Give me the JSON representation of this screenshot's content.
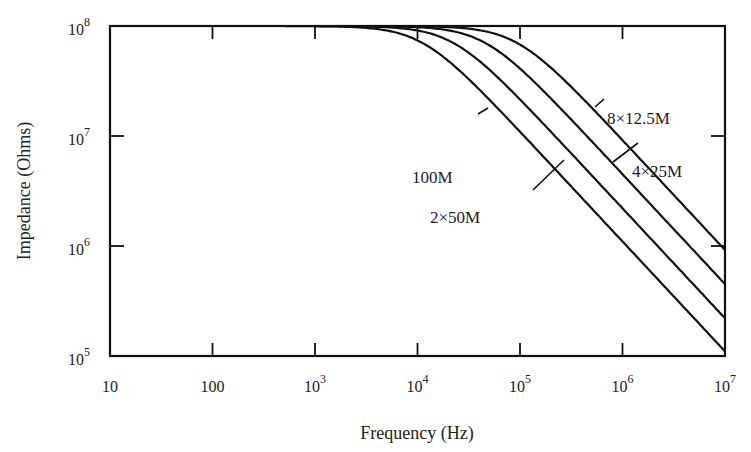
{
  "chart_data": {
    "type": "line",
    "title": "",
    "xlabel": "Frequency (Hz)",
    "ylabel": "Impedance (Ohms)",
    "xscale": "log",
    "yscale": "log",
    "xlim": [
      10,
      10000000
    ],
    "ylim": [
      100000,
      100000000
    ],
    "grid": false,
    "legend": "inline annotations",
    "x_ticks": [
      {
        "value": 10,
        "base": "10",
        "exp": ""
      },
      {
        "value": 100,
        "base": "100",
        "exp": ""
      },
      {
        "value": 1000,
        "base": "10",
        "exp": "3"
      },
      {
        "value": 10000,
        "base": "10",
        "exp": "4"
      },
      {
        "value": 100000,
        "base": "10",
        "exp": "5"
      },
      {
        "value": 1000000,
        "base": "10",
        "exp": "6"
      },
      {
        "value": 10000000,
        "base": "10",
        "exp": "7"
      }
    ],
    "y_ticks": [
      {
        "value": 100000000,
        "base": "10",
        "exp": "8"
      },
      {
        "value": 10000000,
        "base": "10",
        "exp": "7"
      },
      {
        "value": 1000000,
        "base": "10",
        "exp": "6"
      },
      {
        "value": 100000,
        "base": "10",
        "exp": "5"
      }
    ],
    "x": [
      10,
      100,
      1000,
      3000,
      10000,
      30000,
      100000,
      300000,
      1000000,
      3000000,
      10000000
    ],
    "series": [
      {
        "name": "100M",
        "corner_hz": 11000,
        "values": [
          100000000,
          100000000,
          99600000,
          96500000,
          74000000,
          34400000,
          10900000,
          3660000,
          1100000,
          367000,
          110000
        ]
      },
      {
        "name": "2×50M",
        "corner_hz": 22000,
        "values": [
          100000000,
          100000000,
          99900000,
          99100000,
          91000000,
          59100000,
          21500000,
          7310000,
          2200000,
          733000,
          220000
        ]
      },
      {
        "name": "4×25M",
        "corner_hz": 45000,
        "values": [
          100000000,
          100000000,
          100000000,
          99800000,
          97600000,
          83200000,
          41000000,
          14800000,
          4500000,
          1500000,
          450000
        ]
      },
      {
        "name": "8×12.5M",
        "corner_hz": 92000,
        "values": [
          100000000,
          100000000,
          100000000,
          99900000,
          99400000,
          95100000,
          67700000,
          29300000,
          9160000,
          3070000,
          920000
        ]
      }
    ],
    "annotations": [
      {
        "text": "100M",
        "x_px": 412,
        "y_px": 183
      },
      {
        "text": "2×50M",
        "x_px": 430,
        "y_px": 223
      },
      {
        "text": "4×25M",
        "x_px": 632,
        "y_px": 177
      },
      {
        "text": "8×12.5M",
        "x_px": 607,
        "y_px": 124
      }
    ]
  }
}
